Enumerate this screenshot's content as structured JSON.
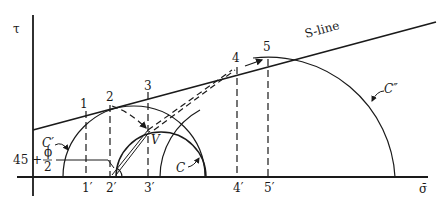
{
  "diagram": {
    "type": "mohr-circle-stress-path",
    "axes": {
      "y_label": "τ",
      "x_label": "σ̄"
    },
    "failure_line": {
      "label": "S-line"
    },
    "points": [
      {
        "id": "1",
        "label": "1",
        "projection_label": "1′"
      },
      {
        "id": "2",
        "label": "2",
        "projection_label": "2′"
      },
      {
        "id": "3",
        "label": "3",
        "projection_label": "3′"
      },
      {
        "id": "4",
        "label": "4",
        "projection_label": "4′"
      },
      {
        "id": "5",
        "label": "5",
        "projection_label": "5′"
      }
    ],
    "pole_label": "V",
    "circles": [
      {
        "id": "C_prime",
        "label": "C′"
      },
      {
        "id": "C",
        "label": "C"
      },
      {
        "id": "C_double_prime",
        "label": "C″"
      }
    ],
    "angle_annotation": {
      "prefix": "45 +",
      "numerator": "ϕ",
      "denominator": "2"
    },
    "colors": {
      "ink": "#1a1a1a",
      "background": "#ffffff"
    }
  }
}
